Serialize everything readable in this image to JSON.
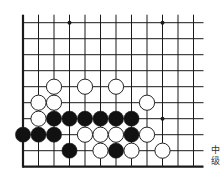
{
  "diagram": {
    "type": "go-board-fragment",
    "grid": {
      "cols": 12,
      "rows": 10,
      "x0": 23,
      "dx": 15.5,
      "y0": 22.7,
      "dy": 16,
      "top_overhang": 8,
      "right_overhang": 10,
      "edges": [
        "left",
        "bottom"
      ]
    },
    "star_points": [
      {
        "col": 3,
        "row": 0
      },
      {
        "col": 9,
        "row": 0
      },
      {
        "col": 9,
        "row": 6
      }
    ],
    "stones": [
      {
        "color": "white",
        "col": 2,
        "row": 4
      },
      {
        "color": "white",
        "col": 4,
        "row": 4
      },
      {
        "color": "white",
        "col": 6,
        "row": 4
      },
      {
        "color": "white",
        "col": 1,
        "row": 5
      },
      {
        "color": "white",
        "col": 2,
        "row": 5
      },
      {
        "color": "white",
        "col": 8,
        "row": 5
      },
      {
        "color": "white",
        "col": 1,
        "row": 6
      },
      {
        "color": "black",
        "col": 2,
        "row": 6
      },
      {
        "color": "black",
        "col": 3,
        "row": 6
      },
      {
        "color": "black",
        "col": 4,
        "row": 6
      },
      {
        "color": "black",
        "col": 5,
        "row": 6
      },
      {
        "color": "black",
        "col": 6,
        "row": 6
      },
      {
        "color": "black",
        "col": 7,
        "row": 6
      },
      {
        "color": "black",
        "col": 0,
        "row": 7
      },
      {
        "color": "black",
        "col": 1,
        "row": 7
      },
      {
        "color": "black",
        "col": 2,
        "row": 7
      },
      {
        "color": "white",
        "col": 4,
        "row": 7
      },
      {
        "color": "white",
        "col": 5,
        "row": 7
      },
      {
        "color": "white",
        "col": 6,
        "row": 7
      },
      {
        "color": "black",
        "col": 7,
        "row": 7
      },
      {
        "color": "white",
        "col": 8,
        "row": 7
      },
      {
        "color": "black",
        "col": 3,
        "row": 8
      },
      {
        "color": "white",
        "col": 5,
        "row": 8
      },
      {
        "color": "black",
        "col": 6,
        "row": 8
      },
      {
        "color": "white",
        "col": 7,
        "row": 8
      },
      {
        "color": "white",
        "col": 9,
        "row": 8
      }
    ],
    "colors": {
      "line": "#1a1a1a",
      "black_stone": "#111111",
      "white_stone": "#ffffff",
      "stone_outline": "#222222"
    },
    "stone_radius": 7.6
  },
  "caption": {
    "line1": "中",
    "line2": "级"
  }
}
